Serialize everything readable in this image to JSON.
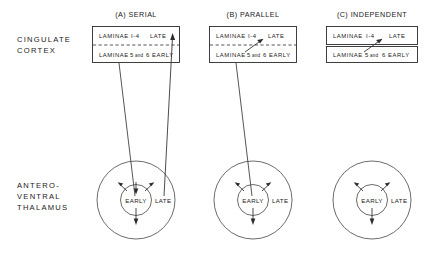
{
  "figure": {
    "type": "neuroanatomical-connectivity-diagram",
    "width": 444,
    "height": 256,
    "background_color": "#ffffff",
    "ink_color": "#2b2b2b"
  },
  "region_labels": {
    "cortex": {
      "line1": "CINGULATE",
      "line2": "CORTEX"
    },
    "thalamus": {
      "line1": "ANTERO-",
      "line2": "VENTRAL",
      "line3": "THALAMUS"
    }
  },
  "panels": [
    {
      "id": "serial",
      "title": "(A) SERIAL",
      "cortex_box": {
        "upper_row": {
          "laminae": "LAMINAE",
          "range": "I-4",
          "timing": "LATE"
        },
        "lower_row": {
          "laminae": "LAMINAE",
          "numbers_prefix": "5",
          "conjunction": "and",
          "numbers_suffix": "6",
          "timing": "EARLY"
        },
        "divider_style": "dashed",
        "split": false,
        "internal_arrow": false
      },
      "thalamus": {
        "inner_label": "EARLY",
        "outer_label": "LATE",
        "radiating_arrows": 4,
        "incoming_lines": 2
      },
      "connections": [
        {
          "from": "thalamus-early",
          "to": "cortex-early-row",
          "direction": "ascending"
        },
        {
          "from": "thalamus-late",
          "to": "cortex-late-row",
          "direction": "ascending",
          "arrowhead": true
        }
      ]
    },
    {
      "id": "parallel",
      "title": "(B) PARALLEL",
      "cortex_box": {
        "upper_row": {
          "laminae": "LAMINAE",
          "range": "I-4",
          "timing": "LATE"
        },
        "lower_row": {
          "laminae": "LAMINAE",
          "numbers_prefix": "5",
          "conjunction": "and",
          "numbers_suffix": "6",
          "timing": "EARLY"
        },
        "divider_style": "dashed",
        "split": false,
        "internal_arrow": true
      },
      "thalamus": {
        "inner_label": "EARLY",
        "outer_label": "LATE",
        "radiating_arrows": 3,
        "incoming_lines": 1
      },
      "connections": [
        {
          "from": "thalamus-early",
          "to": "cortex-early-row",
          "direction": "ascending"
        }
      ]
    },
    {
      "id": "independent",
      "title": "(C) INDEPENDENT",
      "cortex_box": {
        "upper_row": {
          "laminae": "LAMINAE",
          "range": "I-4",
          "timing": "LATE"
        },
        "lower_row": {
          "laminae": "LAMINAE",
          "numbers_prefix": "5",
          "conjunction": "and",
          "numbers_suffix": "6",
          "timing": "EARLY"
        },
        "divider_style": "solid-split",
        "split": true,
        "internal_arrow": true
      },
      "thalamus": {
        "inner_label": "EARLY",
        "outer_label": "LATE",
        "radiating_arrows": 3,
        "incoming_lines": 0
      },
      "connections": []
    }
  ]
}
